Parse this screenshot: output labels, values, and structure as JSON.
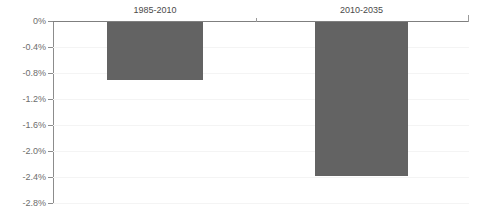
{
  "chart_data": {
    "type": "bar",
    "title": "",
    "subtitle": "",
    "xlabel": "",
    "ylabel": "",
    "categories": [
      "1985-2010",
      "2010-2035"
    ],
    "values": [
      -0.89,
      -2.37
    ],
    "value_labels": [
      "-0.89%",
      "-2.37%"
    ],
    "ylim": [
      -2.8,
      0
    ],
    "ytick_labels": [
      "0%",
      "-0.4%",
      "-0.8%",
      "-1.2%",
      "-1.6%",
      "-2.0%",
      "-2.4%",
      "-2.8%"
    ],
    "ytick_values": [
      0,
      -0.4,
      -0.8,
      -1.2,
      -1.6,
      -2.0,
      -2.4,
      -2.8
    ],
    "grid": true,
    "legend": false,
    "legend_position": "none",
    "series": [
      {
        "name": "",
        "values": [
          -0.89,
          -2.37
        ]
      }
    ],
    "orientation": "vertical",
    "bars_point": "down",
    "annotations": []
  },
  "colors": {
    "bar": "#636363",
    "gridline": "#f4f4f4",
    "axis": "#8c8c8c",
    "zero_axis": "#7f7f7f",
    "tick_label": "#6d6d6d",
    "category_label": "#4a4a4a",
    "background": "#ffffff"
  }
}
